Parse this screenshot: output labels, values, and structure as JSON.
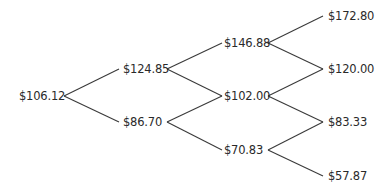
{
  "diagram": {
    "type": "binomial-tree",
    "levels": 4,
    "nodes": [
      {
        "id": "n0",
        "level": 0,
        "label": "$106.12",
        "x": 19,
        "y": 89
      },
      {
        "id": "n1u",
        "level": 1,
        "label": "$124.85",
        "x": 123,
        "y": 62
      },
      {
        "id": "n1d",
        "level": 1,
        "label": "$86.70",
        "x": 123,
        "y": 115
      },
      {
        "id": "n2uu",
        "level": 2,
        "label": "$146.88",
        "x": 224,
        "y": 36
      },
      {
        "id": "n2ud",
        "level": 2,
        "label": "$102.00",
        "x": 224,
        "y": 89
      },
      {
        "id": "n2dd",
        "level": 2,
        "label": "$70.83",
        "x": 224,
        "y": 143
      },
      {
        "id": "n3uuu",
        "level": 3,
        "label": "$172.80",
        "x": 328,
        "y": 9
      },
      {
        "id": "n3uud",
        "level": 3,
        "label": "$120.00",
        "x": 328,
        "y": 62
      },
      {
        "id": "n3udd",
        "level": 3,
        "label": "$83.33",
        "x": 328,
        "y": 115
      },
      {
        "id": "n3ddd",
        "level": 3,
        "label": "$57.87",
        "x": 328,
        "y": 169
      }
    ],
    "edges": [
      {
        "from": "n0",
        "to": "n1u",
        "x1": 64,
        "y1": 96,
        "x2": 119,
        "y2": 69
      },
      {
        "from": "n0",
        "to": "n1d",
        "x1": 64,
        "y1": 96,
        "x2": 119,
        "y2": 122
      },
      {
        "from": "n1u",
        "to": "n2uu",
        "x1": 167,
        "y1": 69,
        "x2": 222,
        "y2": 43
      },
      {
        "from": "n1u",
        "to": "n2ud",
        "x1": 167,
        "y1": 69,
        "x2": 222,
        "y2": 96
      },
      {
        "from": "n1d",
        "to": "n2ud",
        "x1": 167,
        "y1": 122,
        "x2": 222,
        "y2": 96
      },
      {
        "from": "n1d",
        "to": "n2dd",
        "x1": 167,
        "y1": 122,
        "x2": 222,
        "y2": 150
      },
      {
        "from": "n2uu",
        "to": "n3uuu",
        "x1": 268,
        "y1": 43,
        "x2": 323,
        "y2": 16
      },
      {
        "from": "n2uu",
        "to": "n3uud",
        "x1": 268,
        "y1": 43,
        "x2": 323,
        "y2": 69
      },
      {
        "from": "n2ud",
        "to": "n3uud",
        "x1": 268,
        "y1": 96,
        "x2": 323,
        "y2": 69
      },
      {
        "from": "n2ud",
        "to": "n3udd",
        "x1": 268,
        "y1": 96,
        "x2": 323,
        "y2": 122
      },
      {
        "from": "n2dd",
        "to": "n3udd",
        "x1": 268,
        "y1": 150,
        "x2": 323,
        "y2": 122
      },
      {
        "from": "n2dd",
        "to": "n3ddd",
        "x1": 268,
        "y1": 150,
        "x2": 323,
        "y2": 176
      }
    ]
  },
  "colors": {
    "background": "#ffffff",
    "text": "#2a2a2a",
    "line": "#3a3a3a"
  }
}
